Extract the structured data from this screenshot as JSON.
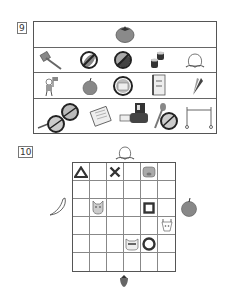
{
  "question_9": {
    "number": "9",
    "rows": [
      {
        "items": [
          "tomato"
        ]
      },
      {
        "items": [
          "axe",
          "eggplant-crossed",
          "ball-crossed",
          "sushi-rolls",
          "peach"
        ]
      },
      {
        "items": [
          "child-with-flag",
          "apple",
          "cake-crossed",
          "notebook",
          "carrot"
        ]
      },
      {
        "items": [
          "pan-crossed",
          "clock-crossed",
          "calendar",
          "bulldozer",
          "spoon-and-bowl-crossed",
          "hurdle-tape"
        ]
      }
    ]
  },
  "question_10": {
    "number": "10",
    "grid": {
      "rows": 6,
      "cols": 6
    },
    "outside": {
      "top": "peach",
      "left": "banana",
      "right": "apple",
      "bottom": "strawberry"
    },
    "cells": [
      {
        "row": 0,
        "col": 0,
        "symbol": "triangle"
      },
      {
        "row": 0,
        "col": 2,
        "symbol": "cross"
      },
      {
        "row": 0,
        "col": 4,
        "symbol": "pig"
      },
      {
        "row": 2,
        "col": 1,
        "symbol": "dog"
      },
      {
        "row": 2,
        "col": 4,
        "symbol": "square"
      },
      {
        "row": 3,
        "col": 5,
        "symbol": "giraffe"
      },
      {
        "row": 4,
        "col": 3,
        "symbol": "raccoon"
      },
      {
        "row": 4,
        "col": 4,
        "symbol": "circle"
      }
    ]
  }
}
